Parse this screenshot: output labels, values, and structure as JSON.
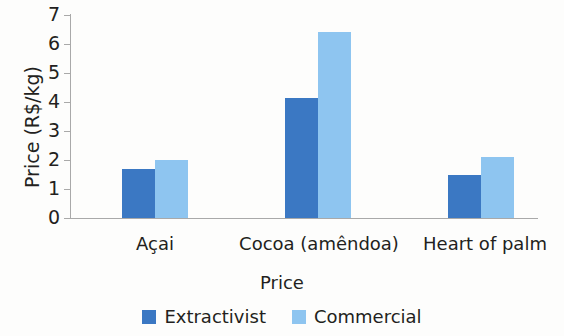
{
  "chart_data": {
    "type": "bar",
    "title": "",
    "xlabel": "Price",
    "ylabel": "Price (R$/kg)",
    "categories": [
      "Açai",
      "Cocoa (amêndoa)",
      "Heart of palm"
    ],
    "series": [
      {
        "name": "Extractivist",
        "color": "#3b78c3",
        "values": [
          1.7,
          4.15,
          1.5
        ]
      },
      {
        "name": "Commercial",
        "color": "#8ec5f0",
        "values": [
          2.0,
          6.4,
          2.1
        ]
      }
    ],
    "ylim": [
      0,
      7
    ],
    "yticks": [
      0,
      1,
      2,
      3,
      4,
      5,
      6,
      7
    ],
    "ytick_labels": [
      "0",
      "1",
      "2",
      "3",
      "4",
      "5",
      "6",
      "7"
    ],
    "grid": false,
    "legend_position": "bottom"
  },
  "axes": {
    "y_title": "Price (R$/kg)",
    "x_title": "Price"
  },
  "ticks": {
    "t0": "0",
    "t1": "1",
    "t2": "2",
    "t3": "3",
    "t4": "4",
    "t5": "5",
    "t6": "6",
    "t7": "7"
  },
  "categories": {
    "c0": "Açai",
    "c1": "Cocoa (amêndoa)",
    "c2": "Heart of palm"
  },
  "legend": {
    "items": [
      {
        "label": "Extractivist",
        "color": "#3b78c3"
      },
      {
        "label": "Commercial",
        "color": "#8ec5f0"
      }
    ],
    "l0": "Extractivist",
    "l1": "Commercial"
  },
  "colors": {
    "extractivist": "#3b78c3",
    "commercial": "#8ec5f0",
    "axis": "#a9a9a9",
    "text": "#231f20",
    "background": "#fdfdfc"
  }
}
